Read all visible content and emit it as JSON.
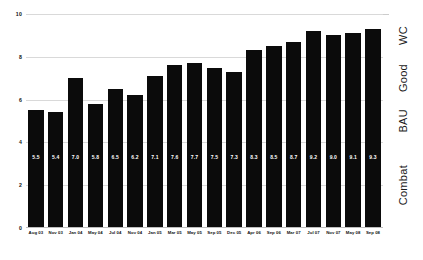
{
  "chart_data": {
    "type": "bar",
    "title": "",
    "subtitle": "",
    "xlabel": "",
    "ylabel": "",
    "ylim": [
      0,
      10
    ],
    "yticks": [
      "0",
      "2",
      "4",
      "6",
      "8",
      "10"
    ],
    "ytick_values": [
      0,
      2,
      4,
      6,
      8,
      10
    ],
    "grid": true,
    "legend": "none",
    "bar_color": "#0b0b0b",
    "value_label_color": "#ffffff",
    "categories": [
      "Aug 03",
      "Nov 03",
      "Jan 04",
      "May 04",
      "Jul 04",
      "Nov 04",
      "Jan 05",
      "Mar 05",
      "May 05",
      "Sep 05",
      "Dec 05",
      "Apr 06",
      "Sep 06",
      "Mar 07",
      "Jul 07",
      "Nov 07",
      "May 08",
      "Sep 08"
    ],
    "values": [
      5.5,
      5.4,
      7.0,
      5.8,
      6.5,
      6.2,
      7.1,
      7.6,
      7.7,
      7.5,
      7.3,
      8.3,
      8.5,
      8.7,
      9.2,
      9.0,
      9.1,
      9.3
    ],
    "value_labels": [
      "5.5",
      "5.4",
      "7.0",
      "5.8",
      "6.5",
      "6.2",
      "7.1",
      "7.6",
      "7.7",
      "7.5",
      "7.3",
      "8.3",
      "8.5",
      "8.7",
      "9.2",
      "9.0",
      "9.1",
      "9.3"
    ],
    "annotations": {
      "right_bands": [
        {
          "label": "Combat",
          "from": 0,
          "to": 4
        },
        {
          "label": "BAU",
          "from": 4,
          "to": 6
        },
        {
          "label": "Good",
          "from": 6,
          "to": 8
        },
        {
          "label": "WC",
          "from": 8,
          "to": 10
        }
      ]
    }
  }
}
